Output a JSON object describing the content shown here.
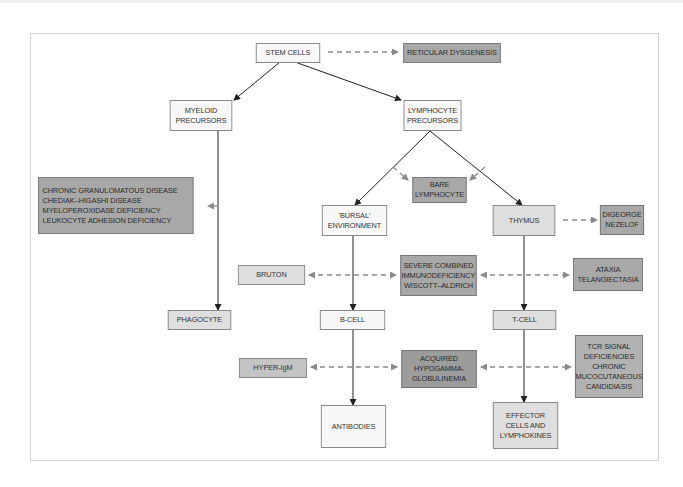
{
  "diagram": {
    "title": "",
    "nodes": {
      "stem_cells": "STEM CELLS",
      "reticular_dysgenesis": "RETICULAR DYSGENESIS",
      "myeloid_precursors": "MYELOID\nPRECURSORS",
      "lymphocyte_precursors": "LYMPHOCYTE\nPRECURSORS",
      "phagocyte_defects": "CHRONIC GRANULOMATOUS DISEASE\nCHEDIAK–HIGASHI DISEASE\nMYELOPEROXIDASE DEFICIENCY\nLEUKOCYTE ADHESION DEFICIENCY",
      "bare_lymphocyte": "BARE\nLYMPHOCYTE",
      "bursal_environment": "'BURSAL'\nENVIRONMENT",
      "thymus": "THYMUS",
      "digeorge_nezelof": "DIGEORGE\nNEZELOF",
      "bruton": "BRUTON",
      "scid_wiscott": "SEVERE COMBINED\nIMMUNODEFICIENCY\nWISCOTT–ALDRICH",
      "ataxia": "ATAXIA\nTELANGIECTASIA",
      "phagocyte": "PHAGOCYTE",
      "b_cell": "B-CELL",
      "t_cell": "T-CELL",
      "hyper_igm": "HYPER-IgM",
      "acquired_hypogamma": "ACQUIRED\nHYPOGAMMA-\nGLOBULINEMIA",
      "tcr_signal": "TCR SIGNAL\nDEFICIENCIES\nCHRONIC\nMUCOCUTANEOUS\nCANDIDIASIS",
      "antibodies": "ANTIBODIES",
      "effector_cells": "EFFECTOR\nCELLS AND\nLYMPHOKINES"
    },
    "colors": {
      "normal_box": "#f7f7f7",
      "stage_box": "#dedede",
      "disease_box": "#a8a8a8",
      "disease_box_light": "#c8c8c8",
      "arrow": "#222222",
      "dashed_arrow": "#8a8a8a"
    }
  }
}
